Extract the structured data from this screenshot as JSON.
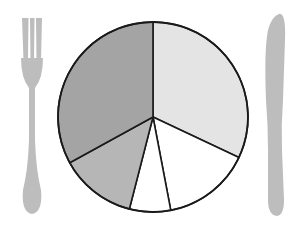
{
  "chart_data": {
    "type": "pie",
    "title": "",
    "start_angle_deg": 0,
    "direction": "clockwise",
    "categories": [
      "Slice A",
      "Slice B",
      "Slice C",
      "Slice D",
      "Slice E"
    ],
    "values": [
      32,
      15,
      7,
      13,
      33
    ],
    "colors": [
      "#e4e4e4",
      "#ffffff",
      "#ffffff",
      "#b6b6b6",
      "#a4a4a4"
    ],
    "legend": [],
    "labels_shown": false,
    "center": [
      153,
      117
    ],
    "radius": 95
  },
  "decorations": {
    "fork_color": "#bdbdbd",
    "knife_color": "#bdbdbd",
    "outline_color": "#1a1a1a"
  }
}
